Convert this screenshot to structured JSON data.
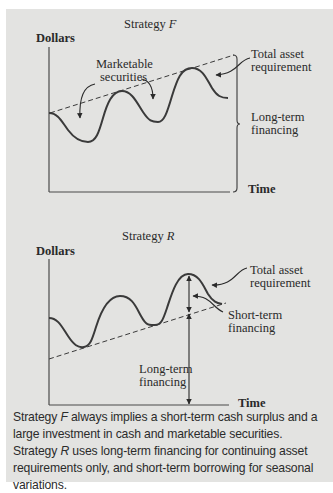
{
  "figure": {
    "background_color": "#e3e3e1",
    "line_color": "#333333"
  },
  "strategy_f": {
    "title_prefix": "Strategy ",
    "title_letter": "F",
    "y_axis_label": "Dollars",
    "x_axis_label": "Time",
    "labels": {
      "marketable_securities_line1": "Marketable",
      "marketable_securities_line2": "securities",
      "total_asset_line1": "Total asset",
      "total_asset_line2": "requirement",
      "long_term_line1": "Long-term",
      "long_term_line2": "financing"
    }
  },
  "strategy_r": {
    "title_prefix": "Strategy ",
    "title_letter": "R",
    "y_axis_label": "Dollars",
    "x_axis_label": "Time",
    "labels": {
      "total_asset_line1": "Total asset",
      "total_asset_line2": "requirement",
      "short_term_line1": "Short-term",
      "short_term_line2": "financing",
      "long_term_line1": "Long-term",
      "long_term_line2": "financing"
    }
  },
  "caption": {
    "line1_prefix": "Strategy ",
    "line1_letter": "F",
    "line1_rest": " always implies a short-term cash surplus and a large investment in cash and marketable securities.",
    "line2_prefix": "Strategy ",
    "line2_letter": "R",
    "line2_rest": " uses long-term financing for continuing asset requirements only, and short-term borrowing for seasonal variations."
  }
}
